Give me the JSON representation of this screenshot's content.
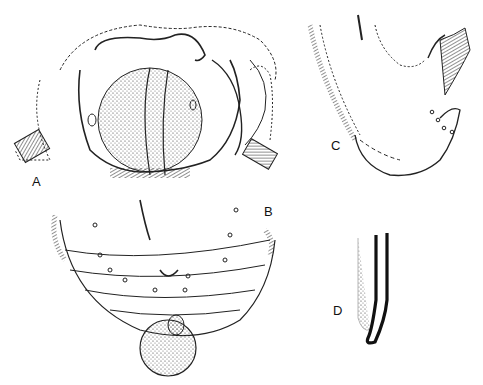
{
  "figure": {
    "panels": [
      {
        "id": "A",
        "label": "A",
        "description": "anterior view, mouthparts with stippled central lobe"
      },
      {
        "id": "B",
        "label": "B",
        "description": "posterior segments, ventral view with papillae"
      },
      {
        "id": "C",
        "label": "C",
        "description": "lateral view of terminal end"
      },
      {
        "id": "D",
        "label": "D",
        "description": "spicule / seta detail"
      }
    ]
  }
}
